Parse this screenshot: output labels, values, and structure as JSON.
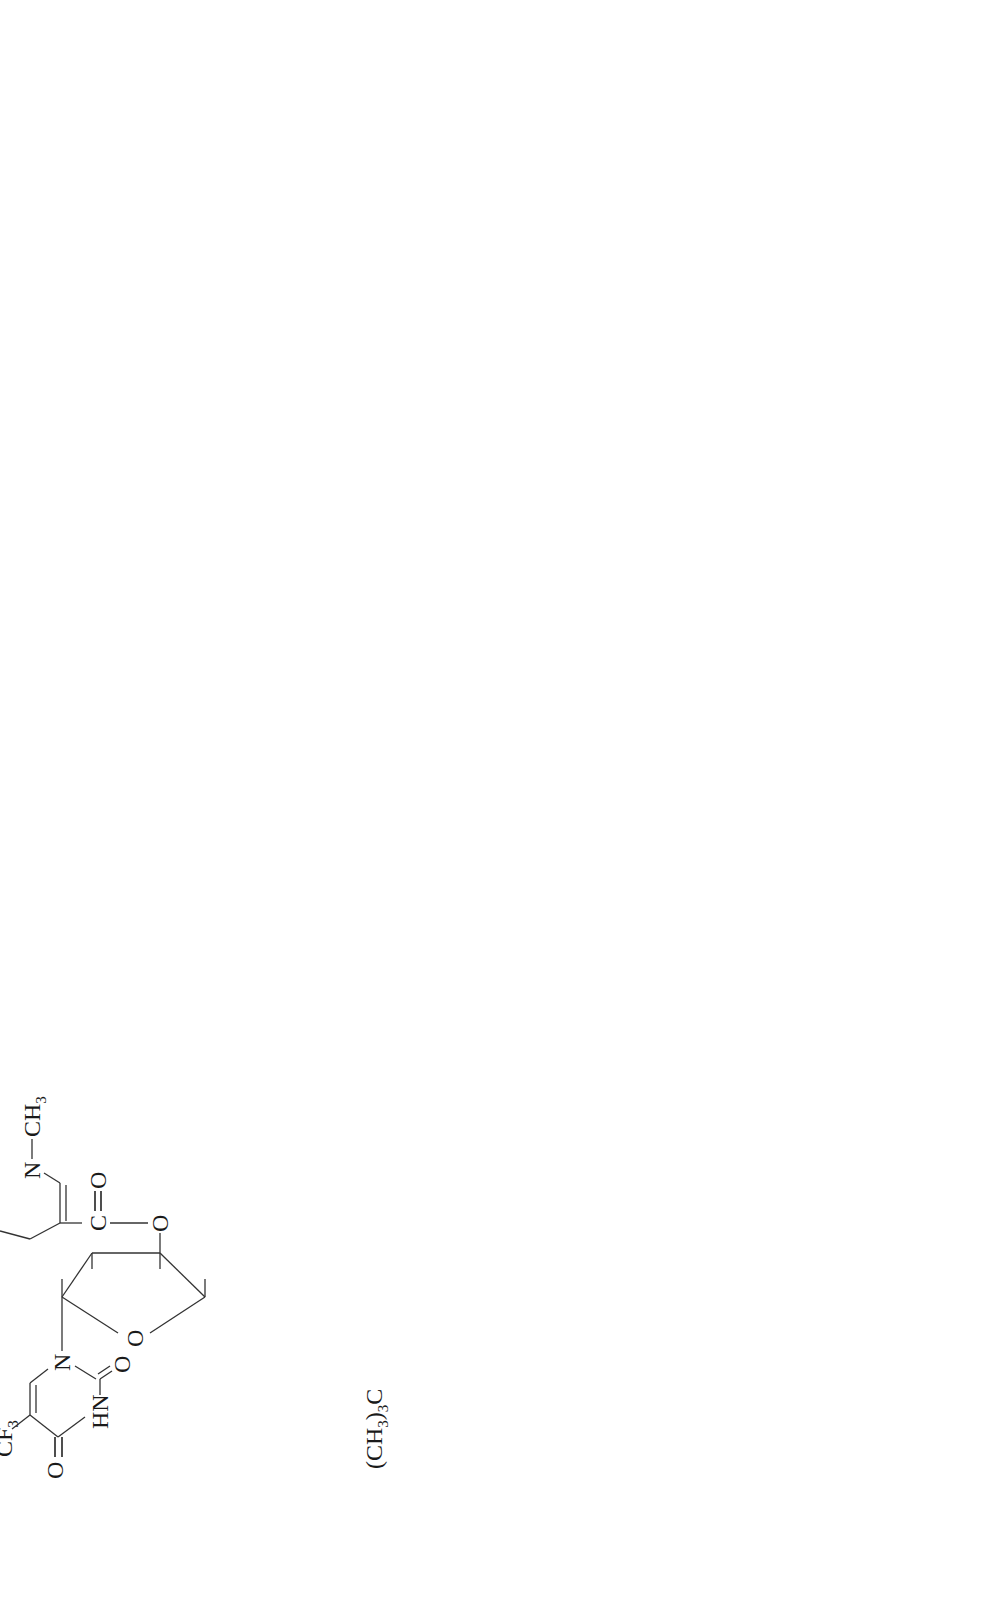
{
  "diagram": {
    "orientation": "rotated 90deg counter-clockwise",
    "transition_label": "crosses BBB",
    "compounds": [
      {
        "id": "A",
        "letter": "A.",
        "name_line1": "Reduced",
        "name_line2": "transport form",
        "ester_group": "(CH3)3C—C(=O)—O—H2C",
        "base_substituent": "CF3",
        "pyridine_group": "1-methyl-1,4-dihydropyridine-3-carbonyl",
        "n_substituent": "CH3"
      },
      {
        "id": "B",
        "letter": "B.",
        "serum": "Serum: 7.9 μg/ml (1 hr)",
        "brain": "Brain: —",
        "hydroxymethyl": "HO—H2C",
        "base_substituent": "CF3",
        "n_substituent": "CH3"
      },
      {
        "id": "C",
        "letter": "C.",
        "name_line1": "Oxidized",
        "name_line2": "transport form",
        "ester_group": "(CH3)3C—C(=O)—O—H2C",
        "base_substituent": "CF3",
        "charge": "⊕",
        "n_substituent": "CH3"
      },
      {
        "id": "D",
        "letter": "D.",
        "name_line1": "Prodrug",
        "serum": "Serum: —",
        "brain_line1": "Brain: 72 μg/g (1 hr)",
        "brain_line2": "156 μg/g (4 hr)",
        "hydroxymethyl": "HO—H2C",
        "base_substituent": "CF3",
        "charge": "⊕",
        "n_substituent": "CH3"
      },
      {
        "id": "E",
        "letter": "E.",
        "name_line1": "Trifluridine",
        "hydroxymethyl": "HO—H2C",
        "hydroxyl": "OH",
        "base_substituent": "CF3"
      }
    ],
    "arrows": [
      {
        "from": "A",
        "to": "C",
        "type": "equilibrium",
        "note": "forward crosses BBB; reverse blocked (X)"
      },
      {
        "from": "A",
        "to": "B",
        "type": "forward"
      },
      {
        "from": "C",
        "to": "D",
        "type": "forward"
      },
      {
        "from": "C",
        "to": "E",
        "type": "forward"
      },
      {
        "from": "D",
        "to": "E",
        "type": "forward (diagonal)"
      }
    ]
  },
  "atoms": {
    "O": "O",
    "N": "N",
    "HN": "HN",
    "C": "C",
    "CF": "CF",
    "three": "3",
    "two": "2",
    "CH": "CH",
    "H": "H",
    "HO": "HO",
    "OH": "OH",
    "CH3paren": "(CH",
    "paren3": ")",
    "plus": "⊕"
  }
}
